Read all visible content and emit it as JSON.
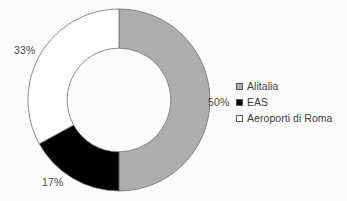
{
  "chart_data": {
    "type": "pie",
    "variant": "donut",
    "title": "",
    "subtitle": "",
    "xlabel": "",
    "ylabel": "",
    "grid": false,
    "legend_position": "right",
    "categories": [
      "Alitalia",
      "EAS",
      "Aeroporti di Roma"
    ],
    "values": [
      50,
      17,
      33
    ],
    "value_unit": "%",
    "data_labels": [
      "50%",
      "17%",
      "33%"
    ],
    "slice_colors": [
      "#ADADAD",
      "#000000",
      "#FFFFFF"
    ],
    "slice_border_color": "#6e6e6e",
    "start_angle_deg": 0,
    "direction": "clockwise",
    "inner_radius_ratio": 0.57,
    "series": [
      {
        "name": "share",
        "values": [
          50,
          17,
          33
        ]
      }
    ],
    "slices": [
      {
        "label": "Alitalia",
        "value": 50,
        "data_label": "50%",
        "color": "#ADADAD",
        "start_deg": 0,
        "end_deg": 180
      },
      {
        "label": "EAS",
        "value": 17,
        "data_label": "17%",
        "color": "#000000",
        "start_deg": 180,
        "end_deg": 241.2
      },
      {
        "label": "Aeroporti di Roma",
        "value": 33,
        "data_label": "33%",
        "color": "#FFFFFF",
        "start_deg": 241.2,
        "end_deg": 360
      }
    ]
  },
  "labels": {
    "alitalia_pct": "50%",
    "eas_pct": "17%",
    "aeroporti_pct": "33%"
  },
  "legend": {
    "items": [
      {
        "label": "Alitalia",
        "color": "#ADADAD"
      },
      {
        "label": "EAS",
        "color": "#000000"
      },
      {
        "label": "Aeroporti di Roma",
        "color": "#FFFFFF"
      }
    ]
  }
}
